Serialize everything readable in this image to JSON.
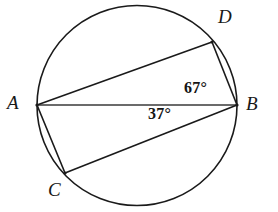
{
  "figure": {
    "background_color": "#ffffff",
    "stroke_color": "#1a1a1a",
    "width": 278,
    "height": 212
  },
  "circle": {
    "name": "circumscribed-circle",
    "center_x": 137,
    "center_y": 105.5,
    "radius": 100
  },
  "points": {
    "A": {
      "label": "A",
      "x": 37,
      "y": 105
    },
    "B": {
      "label": "B",
      "x": 237,
      "y": 105
    },
    "C": {
      "label": "C",
      "x": 65,
      "y": 173
    },
    "D": {
      "label": "D",
      "x": 212,
      "y": 42
    }
  },
  "chords": [
    {
      "name": "chord-AB",
      "from": "A",
      "to": "B",
      "x1": 37,
      "y1": 105,
      "x2": 237,
      "y2": 105
    },
    {
      "name": "chord-AD",
      "from": "A",
      "to": "D",
      "x1": 37,
      "y1": 105,
      "x2": 212,
      "y2": 42
    },
    {
      "name": "chord-DB",
      "from": "D",
      "to": "B",
      "x1": 212,
      "y1": 42,
      "x2": 237,
      "y2": 105
    },
    {
      "name": "chord-AC",
      "from": "A",
      "to": "C",
      "x1": 37,
      "y1": 105,
      "x2": 65,
      "y2": 173
    },
    {
      "name": "chord-CB",
      "from": "C",
      "to": "B",
      "x1": 65,
      "y1": 173,
      "x2": 237,
      "y2": 105
    }
  ],
  "angles": {
    "dba": {
      "value": "67°",
      "vertex": "B",
      "between": "BD and BA",
      "position": "above-line-AB-near-B"
    },
    "abc": {
      "value": "37°",
      "vertex": "B",
      "between": "BA and BC",
      "position": "below-line-AB-near-B"
    }
  }
}
